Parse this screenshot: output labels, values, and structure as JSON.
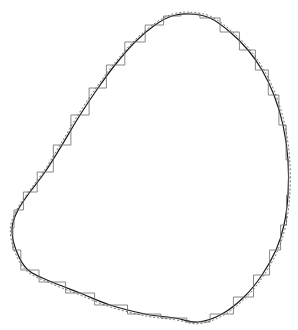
{
  "figure": {
    "colors": {
      "background": "#ffffff",
      "smooth_curve": "#1a1a1a",
      "dashed_curve": "#555555",
      "stair_steps": "#6a6a6a"
    },
    "contour_points": [
      [
        190,
        14
      ],
      [
        210,
        18
      ],
      [
        230,
        32
      ],
      [
        248,
        50
      ],
      [
        262,
        70
      ],
      [
        274,
        95
      ],
      [
        283,
        125
      ],
      [
        288,
        160
      ],
      [
        288,
        195
      ],
      [
        284,
        225
      ],
      [
        276,
        250
      ],
      [
        262,
        275
      ],
      [
        244,
        297
      ],
      [
        222,
        314
      ],
      [
        198,
        322
      ],
      [
        175,
        318
      ],
      [
        145,
        314
      ],
      [
        110,
        305
      ],
      [
        80,
        293
      ],
      [
        52,
        282
      ],
      [
        28,
        270
      ],
      [
        16,
        250
      ],
      [
        12,
        228
      ],
      [
        18,
        210
      ],
      [
        30,
        192
      ],
      [
        45,
        172
      ],
      [
        62,
        145
      ],
      [
        80,
        115
      ],
      [
        98,
        88
      ],
      [
        115,
        65
      ],
      [
        135,
        42
      ],
      [
        155,
        25
      ],
      [
        172,
        16
      ]
    ]
  }
}
